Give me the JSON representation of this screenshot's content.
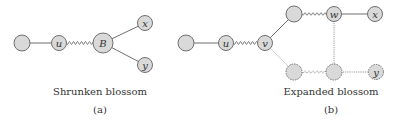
{
  "panels": [
    {
      "id": "a",
      "caption": "Shrunken blossom",
      "sublabel": "(a)",
      "nodes": [
        {
          "id": "a0",
          "label": "",
          "x": 22,
          "y": 43,
          "r": 8,
          "style": "solid"
        },
        {
          "id": "a_u",
          "label": "u",
          "x": 59,
          "y": 43,
          "r": 7.5,
          "style": "solid"
        },
        {
          "id": "a_B",
          "label": "B",
          "x": 103,
          "y": 43,
          "r": 10,
          "style": "solid"
        },
        {
          "id": "a_x",
          "label": "x",
          "x": 145,
          "y": 23,
          "r": 7.5,
          "style": "solid"
        },
        {
          "id": "a_y",
          "label": "y",
          "x": 145,
          "y": 65,
          "r": 7.5,
          "style": "solid"
        }
      ],
      "edges": [
        {
          "from": "a0",
          "to": "a_u",
          "style": "solid"
        },
        {
          "from": "a_u",
          "to": "a_B",
          "style": "wavy"
        },
        {
          "from": "a_B",
          "to": "a_x",
          "style": "solid"
        },
        {
          "from": "a_B",
          "to": "a_y",
          "style": "solid"
        }
      ]
    },
    {
      "id": "b",
      "caption": "Expanded blossom",
      "sublabel": "(b)",
      "nodes": [
        {
          "id": "b0",
          "label": "",
          "x": 186,
          "y": 43,
          "r": 8,
          "style": "solid"
        },
        {
          "id": "b_u",
          "label": "u",
          "x": 226,
          "y": 43,
          "r": 7.5,
          "style": "solid"
        },
        {
          "id": "b_v",
          "label": "v",
          "x": 265,
          "y": 43,
          "r": 7.5,
          "style": "solid"
        },
        {
          "id": "b_t",
          "label": "",
          "x": 294,
          "y": 14,
          "r": 8,
          "style": "solid"
        },
        {
          "id": "b_w",
          "label": "w",
          "x": 334,
          "y": 14,
          "r": 7.5,
          "style": "solid"
        },
        {
          "id": "b_x",
          "label": "x",
          "x": 375,
          "y": 14,
          "r": 7.5,
          "style": "solid"
        },
        {
          "id": "b_bl",
          "label": "",
          "x": 294,
          "y": 72,
          "r": 8,
          "style": "dotted"
        },
        {
          "id": "b_bm",
          "label": "",
          "x": 334,
          "y": 72,
          "r": 8,
          "style": "dotted"
        },
        {
          "id": "b_y",
          "label": "y",
          "x": 376,
          "y": 72,
          "r": 7.5,
          "style": "dotted"
        }
      ],
      "edges": [
        {
          "from": "b0",
          "to": "b_u",
          "style": "solid"
        },
        {
          "from": "b_u",
          "to": "b_v",
          "style": "wavy"
        },
        {
          "from": "b_v",
          "to": "b_t",
          "style": "solid"
        },
        {
          "from": "b_t",
          "to": "b_w",
          "style": "wavy"
        },
        {
          "from": "b_w",
          "to": "b_x",
          "style": "solid"
        },
        {
          "from": "b_w",
          "to": "b_bm",
          "style": "dotted"
        },
        {
          "from": "b_v",
          "to": "b_bl",
          "style": "faint"
        },
        {
          "from": "b_bl",
          "to": "b_bm",
          "style": "wavy-dotted"
        },
        {
          "from": "b_bm",
          "to": "b_y",
          "style": "dotted"
        }
      ]
    }
  ],
  "captions": {
    "a_title": "Shrunken blossom",
    "a_label": "(a)",
    "b_title": "Expanded blossom",
    "b_label": "(b)"
  },
  "colors": {
    "node_fill": "#d9d9d9",
    "node_stroke": "#6f6f6f",
    "edge": "#6f6f6f",
    "text": "#333333"
  }
}
